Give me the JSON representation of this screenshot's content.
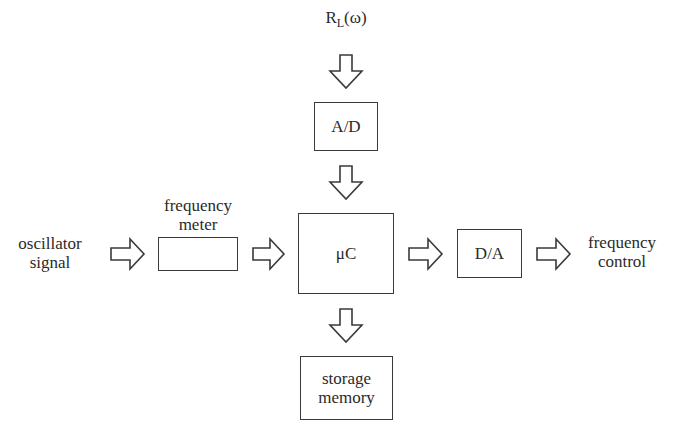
{
  "diagram": {
    "type": "block-diagram",
    "input_top": {
      "main": "R",
      "subscript": "L",
      "suffix": "(ω)"
    },
    "blocks": {
      "ad": "A/D",
      "freq_meter": "",
      "uc": "μC",
      "da": "D/A",
      "storage": "storage\nmemory"
    },
    "labels": {
      "oscillator_signal": "oscillator\nsignal",
      "frequency_meter": "frequency\nmeter",
      "frequency_control": "frequency\ncontrol"
    },
    "connections": [
      {
        "from": "RL(ω)",
        "to": "A/D",
        "direction": "down"
      },
      {
        "from": "A/D",
        "to": "μC",
        "direction": "down"
      },
      {
        "from": "oscillator signal",
        "to": "frequency meter",
        "direction": "right"
      },
      {
        "from": "frequency meter",
        "to": "μC",
        "direction": "right"
      },
      {
        "from": "μC",
        "to": "D/A",
        "direction": "right"
      },
      {
        "from": "D/A",
        "to": "frequency control",
        "direction": "right"
      },
      {
        "from": "μC",
        "to": "storage memory",
        "direction": "down"
      }
    ]
  }
}
